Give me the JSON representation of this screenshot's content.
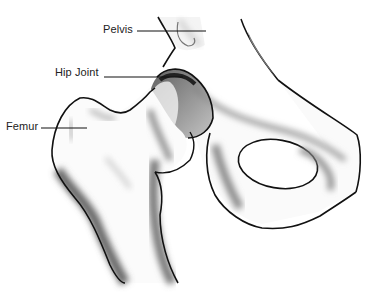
{
  "diagram": {
    "labels": [
      {
        "text": "Pelvis",
        "x": 103,
        "y": 22
      },
      {
        "text": "Hip Joint",
        "x": 55,
        "y": 65
      },
      {
        "text": "Femur",
        "x": 6,
        "y": 119
      }
    ],
    "colors": {
      "line": "#111111",
      "shade": "#6b6b6b",
      "background": "#ffffff"
    }
  }
}
